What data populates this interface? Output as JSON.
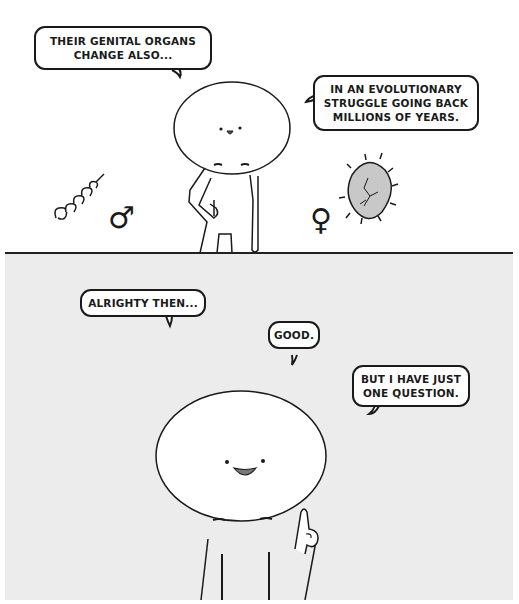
{
  "comic": {
    "panels": [
      {
        "id": "top",
        "background": "#ffffff",
        "bubbles": [
          {
            "text": "THEIR GENITAL ORGANS\nCHANGE ALSO..."
          },
          {
            "text": "IN AN EVOLUTIONARY\nSTRUGGLE GOING BACK\nMILLIONS OF YEARS."
          }
        ],
        "symbols": {
          "male": "♂",
          "female": "♀"
        }
      },
      {
        "id": "bottom",
        "background": "#ececec",
        "bubbles": [
          {
            "text": "ALRIGHTY THEN..."
          },
          {
            "text": "GOOD."
          },
          {
            "text": "BUT I HAVE JUST\nONE QUESTION."
          }
        ]
      }
    ],
    "colors": {
      "ink": "#1a1a1a",
      "egg_fill": "#c8c8c8",
      "mouth_fill": "#777777"
    }
  }
}
